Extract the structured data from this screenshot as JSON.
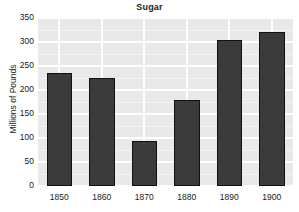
{
  "chart_data": {
    "type": "bar",
    "title": "Sugar",
    "xlabel": "",
    "ylabel": "Millions of Pounds",
    "categories": [
      "1850",
      "1860",
      "1870",
      "1880",
      "1890",
      "1900"
    ],
    "values": [
      235,
      225,
      93,
      180,
      305,
      320
    ],
    "ylim": [
      0,
      350
    ],
    "yticks": [
      0,
      50,
      100,
      150,
      200,
      250,
      300,
      350
    ],
    "ytick_labels": [
      "0",
      "50",
      "100",
      "150",
      "200",
      "250",
      "300",
      "350"
    ],
    "grid": true,
    "legend": "none",
    "series": [
      {
        "name": "Sugar",
        "values": [
          235,
          225,
          93,
          180,
          305,
          320
        ]
      }
    ]
  },
  "style": {
    "panel_background": "#e9e9e9",
    "gridline_color": "#ffffff",
    "bar_fill": "#3b3b3b",
    "bar_outline": "#111111",
    "text_color": "#1a1a1a",
    "figure_background": "#ffffff"
  }
}
